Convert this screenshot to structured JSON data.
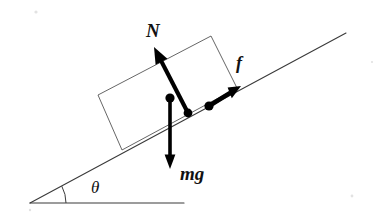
{
  "figure": {
    "background_color": "#ffffff",
    "width": 388,
    "height": 219
  },
  "labels": {
    "normal_force": "N",
    "friction_force": "f",
    "weight": "mg",
    "angle": "θ"
  },
  "colors": {
    "line": "#3a3a3a",
    "box_outline": "#555555",
    "vector": "#000000",
    "text": "#111111"
  },
  "geometry": {
    "incline": {
      "apex": [
        30,
        203
      ],
      "top_end": [
        346,
        33
      ],
      "angle_degrees": 28
    },
    "baseline": {
      "start": [
        30,
        203
      ],
      "end": [
        184,
        203
      ]
    },
    "angle_arc": {
      "center": [
        30,
        203
      ],
      "radius": 36,
      "start": [
        65,
        203
      ],
      "end": [
        62,
        186
      ]
    },
    "block": {
      "corners": [
        [
          122,
          150
        ],
        [
          98,
          95
        ],
        [
          211,
          36
        ],
        [
          237,
          88
        ]
      ]
    },
    "vectors": [
      {
        "name": "normal",
        "label": "N",
        "tail": [
          188,
          113
        ],
        "tip": [
          154,
          47
        ],
        "has_dot_at_tail": true
      },
      {
        "name": "friction",
        "label": "f",
        "tail": [
          209,
          106
        ],
        "tip": [
          241,
          86
        ],
        "has_dot_at_tail": true
      },
      {
        "name": "weight",
        "label": "mg",
        "tail": [
          170,
          98
        ],
        "tip": [
          170,
          169
        ],
        "has_dot_at_tail": true
      }
    ],
    "label_positions": {
      "N": [
        146,
        36
      ],
      "f": [
        238,
        68
      ],
      "mg": [
        180,
        179
      ],
      "theta": [
        92,
        192
      ]
    }
  }
}
